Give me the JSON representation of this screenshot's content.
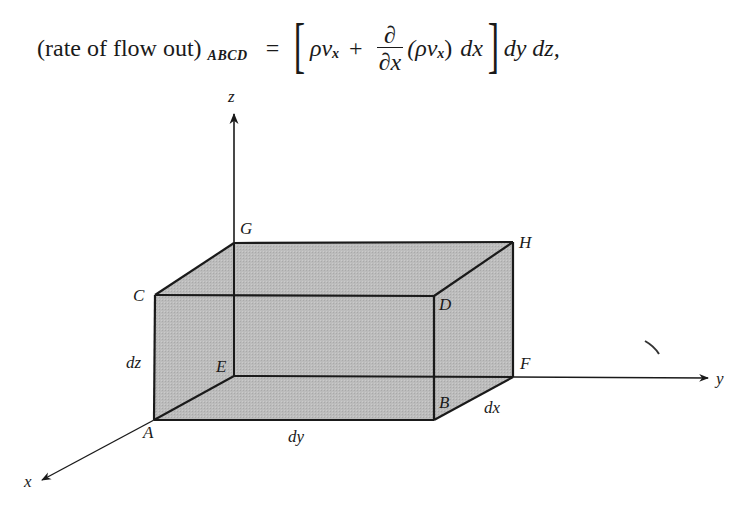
{
  "equation": {
    "lhs_text": "(rate of flow out)",
    "lhs_subscript": "ABCD",
    "equals": "=",
    "bracket_open": "[",
    "term1_rho": "ρv",
    "term1_sub": "x",
    "plus": "+",
    "partial_num": "∂",
    "partial_den": "∂x",
    "term2_paren_open": "(ρv",
    "term2_sub": "x",
    "term2_paren_close": ")",
    "term2_dx": "dx",
    "bracket_close": "]",
    "tail": "dy dz,"
  },
  "diagram": {
    "axes": {
      "x_label": "x",
      "y_label": "y",
      "z_label": "z"
    },
    "vertices": {
      "A": "A",
      "B": "B",
      "C": "C",
      "D": "D",
      "E": "E",
      "F": "F",
      "G": "G",
      "H": "H"
    },
    "dimensions": {
      "dx": "dx",
      "dy": "dy",
      "dz": "dz"
    },
    "colors": {
      "box_fill": "#b8b8b8",
      "edge": "#1a1a1a",
      "background": "#ffffff"
    }
  }
}
